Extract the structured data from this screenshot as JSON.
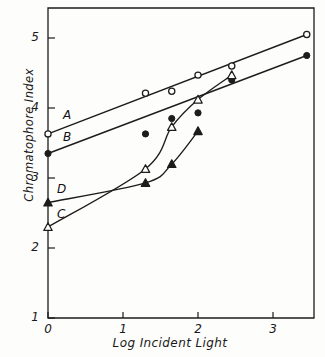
{
  "chart_data": {
    "type": "line",
    "title": "",
    "xlabel": "Log Incident Light",
    "ylabel": "Chromatophore Index",
    "xlim": [
      -0.25,
      3.7
    ],
    "ylim": [
      1,
      5.1
    ],
    "xticks": [
      0,
      1,
      2,
      3
    ],
    "yticks": [
      1,
      2,
      3,
      4,
      5
    ],
    "xtick_labels": [
      "0",
      "1",
      "2",
      "3"
    ],
    "ytick_labels": [
      "1",
      "2",
      "3",
      "4",
      "5"
    ],
    "grid": false,
    "legend": "inline-series-labels",
    "series": [
      {
        "name": "A",
        "label": "A",
        "marker": "open-circle",
        "line": "straight",
        "x": [
          0.0,
          1.3,
          1.65,
          2.0,
          2.45,
          3.45
        ],
        "y": [
          3.63,
          4.21,
          4.24,
          4.47,
          4.6,
          5.05
        ]
      },
      {
        "name": "B",
        "label": "B",
        "marker": "filled-circle",
        "line": "straight",
        "x": [
          0.0,
          1.3,
          1.65,
          2.0,
          2.45,
          3.45
        ],
        "y": [
          3.35,
          3.63,
          3.85,
          3.93,
          4.4,
          4.75
        ]
      },
      {
        "name": "C",
        "label": "C",
        "marker": "open-triangle",
        "line": "curved",
        "x": [
          0.0,
          1.3,
          1.65,
          2.0,
          2.45
        ],
        "y": [
          2.3,
          3.13,
          3.73,
          4.12,
          4.47
        ]
      },
      {
        "name": "D",
        "label": "D",
        "marker": "filled-triangle",
        "line": "curved",
        "x": [
          0.0,
          1.3,
          1.65,
          2.0
        ],
        "y": [
          2.65,
          2.93,
          3.2,
          3.67
        ]
      }
    ],
    "series_label_positions": [
      {
        "label": "A",
        "x": 0.2,
        "y": 3.88
      },
      {
        "label": "B",
        "x": 0.2,
        "y": 3.57
      },
      {
        "label": "C",
        "x": 0.12,
        "y": 2.47
      },
      {
        "label": "D",
        "x": 0.12,
        "y": 2.83
      }
    ]
  }
}
